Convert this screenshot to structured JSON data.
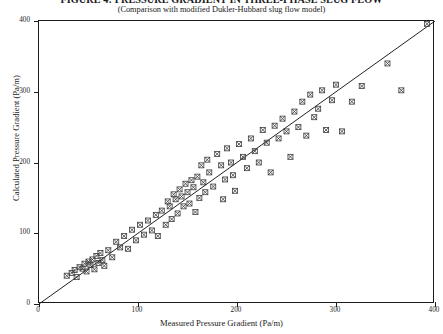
{
  "title": "FIGURE 4: PRESSURE GRADIENT IN THREE-PHASE SLUG FLOW",
  "subtitle": "(Comparison with modified Dukler-Hubbard slug flow model)",
  "colors": {
    "axis": "#1b1b1b",
    "marker": "#3a3a3a",
    "parity_line": "#222222",
    "background": "#ffffff"
  },
  "chart_data": {
    "type": "scatter",
    "title": "FIGURE 4: PRESSURE GRADIENT IN THREE-PHASE SLUG FLOW",
    "subtitle": "(Comparison with modified Dukler-Hubbard slug flow model)",
    "xlabel": "Measured Pressure Gradient (Pa/m)",
    "ylabel": "Calculated Pressure Gradient (Pa/m)",
    "xlim": [
      0,
      400
    ],
    "ylim": [
      0,
      400
    ],
    "xticks": [
      0,
      100,
      200,
      300,
      400
    ],
    "yticks": [
      0,
      100,
      200,
      300,
      400
    ],
    "xtick_labels": [
      "0",
      "100",
      "200",
      "300",
      "400"
    ],
    "ytick_labels": [
      "0",
      "100",
      "200",
      "300",
      "400"
    ],
    "grid": false,
    "legend": null,
    "marker_style": "boxed-x",
    "reference_line": {
      "name": "parity line (y = x)",
      "slope": 1,
      "intercept": 0,
      "from": [
        0,
        0
      ],
      "to": [
        400,
        400
      ]
    },
    "series": [
      {
        "name": "Measured vs Calculated Pressure Gradient",
        "points": [
          [
            28,
            40
          ],
          [
            33,
            44
          ],
          [
            36,
            48
          ],
          [
            38,
            38
          ],
          [
            41,
            52
          ],
          [
            44,
            50
          ],
          [
            46,
            57
          ],
          [
            48,
            46
          ],
          [
            50,
            60
          ],
          [
            52,
            55
          ],
          [
            54,
            63
          ],
          [
            56,
            49
          ],
          [
            58,
            68
          ],
          [
            60,
            58
          ],
          [
            62,
            72
          ],
          [
            64,
            62
          ],
          [
            66,
            54
          ],
          [
            70,
            76
          ],
          [
            74,
            66
          ],
          [
            78,
            88
          ],
          [
            82,
            80
          ],
          [
            86,
            96
          ],
          [
            90,
            78
          ],
          [
            94,
            105
          ],
          [
            98,
            90
          ],
          [
            102,
            112
          ],
          [
            106,
            98
          ],
          [
            110,
            118
          ],
          [
            114,
            104
          ],
          [
            118,
            126
          ],
          [
            120,
            96
          ],
          [
            124,
            132
          ],
          [
            128,
            112
          ],
          [
            130,
            145
          ],
          [
            132,
            138
          ],
          [
            134,
            120
          ],
          [
            136,
            155
          ],
          [
            138,
            148
          ],
          [
            140,
            128
          ],
          [
            142,
            162
          ],
          [
            144,
            152
          ],
          [
            146,
            138
          ],
          [
            148,
            170
          ],
          [
            150,
            158
          ],
          [
            152,
            142
          ],
          [
            154,
            175
          ],
          [
            156,
            165
          ],
          [
            158,
            130
          ],
          [
            160,
            180
          ],
          [
            162,
            150
          ],
          [
            164,
            196
          ],
          [
            166,
            172
          ],
          [
            168,
            158
          ],
          [
            170,
            204
          ],
          [
            172,
            186
          ],
          [
            176,
            166
          ],
          [
            180,
            212
          ],
          [
            184,
            196
          ],
          [
            186,
            148
          ],
          [
            188,
            176
          ],
          [
            190,
            220
          ],
          [
            194,
            200
          ],
          [
            196,
            182
          ],
          [
            198,
            160
          ],
          [
            202,
            226
          ],
          [
            206,
            208
          ],
          [
            210,
            192
          ],
          [
            214,
            234
          ],
          [
            218,
            216
          ],
          [
            222,
            200
          ],
          [
            226,
            246
          ],
          [
            230,
            228
          ],
          [
            234,
            186
          ],
          [
            238,
            252
          ],
          [
            242,
            234
          ],
          [
            246,
            262
          ],
          [
            250,
            244
          ],
          [
            254,
            208
          ],
          [
            258,
            272
          ],
          [
            262,
            250
          ],
          [
            266,
            286
          ],
          [
            270,
            238
          ],
          [
            274,
            296
          ],
          [
            278,
            264
          ],
          [
            282,
            276
          ],
          [
            286,
            302
          ],
          [
            290,
            246
          ],
          [
            296,
            288
          ],
          [
            300,
            310
          ],
          [
            306,
            244
          ],
          [
            316,
            286
          ],
          [
            326,
            308
          ],
          [
            352,
            340
          ],
          [
            366,
            302
          ],
          [
            392,
            396
          ]
        ]
      }
    ]
  },
  "axes": {
    "y_title": "Calculated Pressure Gradient (Pa/m)",
    "x_title": "Measured Pressure Gradient (Pa/m)"
  }
}
